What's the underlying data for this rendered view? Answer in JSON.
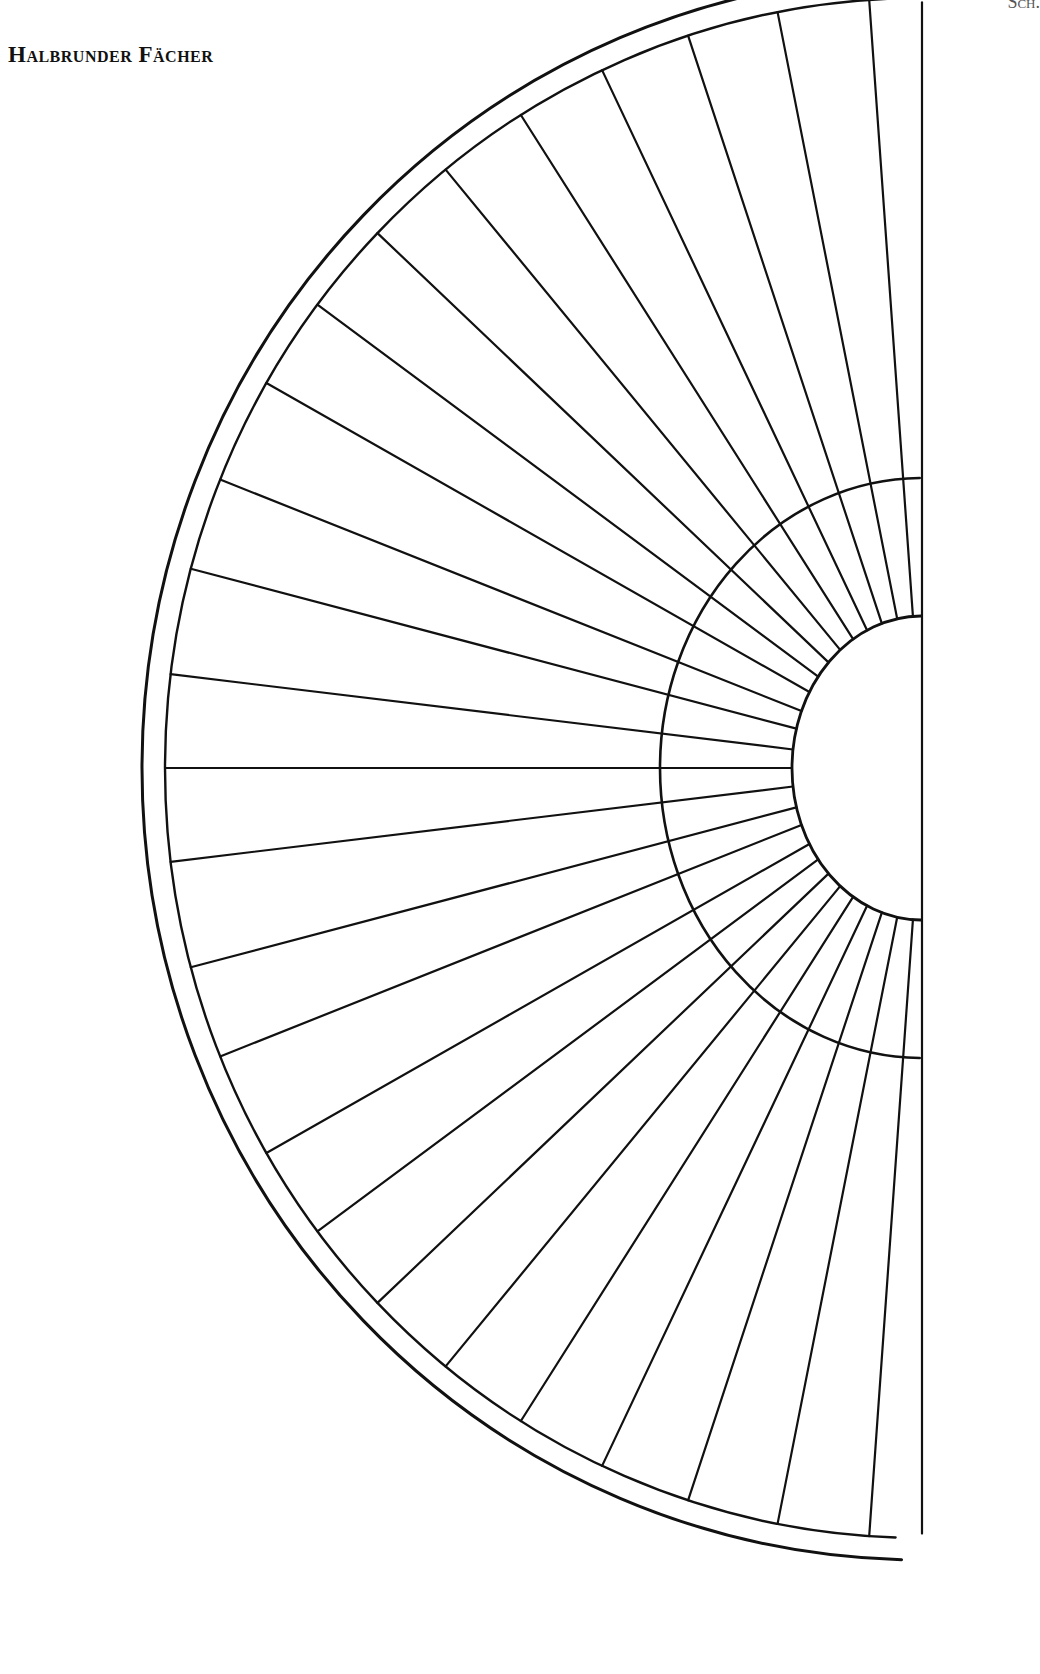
{
  "page": {
    "title": "Halbrunder Fächer",
    "corner_label": "Sch."
  },
  "diagram": {
    "stroke_color": "#111111",
    "center": [
      922,
      768
    ],
    "outer_arc_outer": {
      "rx": 780,
      "ry": 792
    },
    "outer_arc_inner": {
      "rx": 757,
      "ry": 770
    },
    "middle_arc": {
      "rx": 262,
      "ry": 290
    },
    "hub": {
      "rx": 130,
      "ry": 152
    },
    "spoke_count": 25,
    "spoke_angles_deg": [
      -86,
      -79,
      -72,
      -65,
      -58,
      -51,
      -44,
      -37,
      -30,
      -22,
      -15,
      -7,
      0,
      7,
      15,
      22,
      30,
      37,
      44,
      51,
      58,
      65,
      72,
      79,
      86
    ],
    "long_spokes_from_hub": [
      false,
      false,
      true,
      true,
      true,
      true,
      true,
      true,
      true,
      true,
      true,
      true,
      true,
      true,
      true,
      true,
      true,
      true,
      true,
      true,
      true,
      true,
      true,
      false,
      false
    ]
  }
}
